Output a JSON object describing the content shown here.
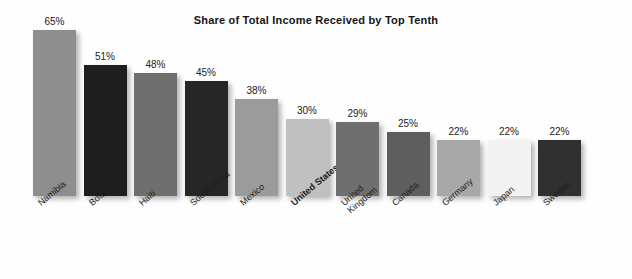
{
  "chart_data": {
    "type": "bar",
    "title": "Share of Total Income Received by Top Tenth",
    "xlabel": "",
    "ylabel": "",
    "ylim": [
      0,
      70
    ],
    "grid": false,
    "legend": "none",
    "categories": [
      "Namibia",
      "Botswana",
      "Haiti",
      "South Africa",
      "Mexico",
      "United States",
      "United\nKingdom",
      "Canada",
      "Germany",
      "Japan",
      "Sweden"
    ],
    "values": [
      65,
      51,
      48,
      45,
      38,
      30,
      29,
      25,
      22,
      22,
      22
    ],
    "value_labels": [
      "65%",
      "51%",
      "48%",
      "45%",
      "38%",
      "30%",
      "29%",
      "25%",
      "22%",
      "22%",
      "22%"
    ],
    "bar_colors": [
      "#8e8e8e",
      "#1e1e1e",
      "#6e6e6e",
      "#262626",
      "#9b9b9b",
      "#c0c0c0",
      "#6f6f6f",
      "#5e5e5e",
      "#a8a8a8",
      "#f2f2f2",
      "#303030"
    ],
    "highlighted_category": "United States"
  },
  "colors": {
    "background": "#fefefe",
    "text": "#1c1c1c",
    "title": "#141414"
  }
}
